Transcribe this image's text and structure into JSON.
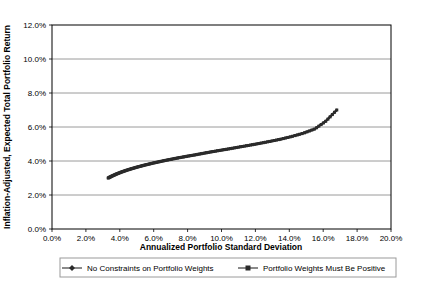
{
  "chart_data": {
    "type": "scatter",
    "title": "",
    "xlabel": "Annualized Portfolio Standard Deviation",
    "ylabel": "Inflation-Adjusted, Expected Total Portfolio Return",
    "xlim": [
      0,
      20
    ],
    "ylim": [
      0,
      12
    ],
    "x_tick_labels": [
      "0.0%",
      "2.0%",
      "4.0%",
      "6.0%",
      "8.0%",
      "10.0%",
      "12.0%",
      "14.0%",
      "16.0%",
      "18.0%",
      "20.0%"
    ],
    "x_tick_values": [
      0,
      2,
      4,
      6,
      8,
      10,
      12,
      14,
      16,
      18,
      20
    ],
    "y_tick_labels": [
      "0.0%",
      "2.0%",
      "4.0%",
      "6.0%",
      "8.0%",
      "10.0%",
      "12.0%"
    ],
    "y_tick_values": [
      0,
      2,
      4,
      6,
      8,
      10,
      12
    ],
    "grid": "horizontal",
    "legend_position": "bottom",
    "series": [
      {
        "name": "No Constraints on Portfolio Weights",
        "marker": "diamond",
        "color": "#2b2b2b",
        "x": [
          3.3,
          3.45,
          3.62,
          3.8,
          4.0,
          4.22,
          4.46,
          4.72,
          5.0,
          5.3,
          5.62,
          5.96,
          6.32,
          6.7,
          7.1,
          7.52,
          7.96,
          8.42,
          8.9,
          9.4,
          9.92,
          10.46,
          11.02,
          11.6,
          12.2,
          12.82,
          13.46,
          14.12,
          14.8,
          15.5,
          16.15,
          16.8
        ],
        "y": [
          3.0,
          3.08,
          3.16,
          3.24,
          3.32,
          3.4,
          3.48,
          3.56,
          3.64,
          3.72,
          3.8,
          3.88,
          3.96,
          4.04,
          4.12,
          4.2,
          4.28,
          4.36,
          4.45,
          4.54,
          4.63,
          4.72,
          4.82,
          4.92,
          5.03,
          5.15,
          5.28,
          5.44,
          5.63,
          5.89,
          6.35,
          7.0
        ]
      },
      {
        "name": "Portfolio Weights Must Be Positive",
        "marker": "square",
        "color": "#2b2b2b",
        "x": [
          3.32,
          3.47,
          3.64,
          3.82,
          4.02,
          4.24,
          4.48,
          4.74,
          5.02,
          5.32,
          5.64,
          5.98,
          6.34,
          6.72,
          7.12,
          7.54,
          7.98,
          8.44,
          8.92,
          9.42,
          9.94,
          10.48,
          11.04,
          11.62,
          12.22,
          12.84,
          13.48,
          14.14,
          14.82,
          15.52,
          16.17,
          16.8
        ],
        "y": [
          3.0,
          3.08,
          3.16,
          3.24,
          3.32,
          3.4,
          3.48,
          3.56,
          3.64,
          3.72,
          3.8,
          3.88,
          3.96,
          4.04,
          4.12,
          4.2,
          4.28,
          4.36,
          4.45,
          4.54,
          4.63,
          4.72,
          4.82,
          4.92,
          5.03,
          5.15,
          5.28,
          5.44,
          5.63,
          5.89,
          6.35,
          7.0
        ]
      }
    ]
  },
  "legend": {
    "items": [
      {
        "label": "No Constraints on Portfolio Weights",
        "marker": "diamond-marker-icon"
      },
      {
        "label": "Portfolio Weights Must Be Positive",
        "marker": "square-marker-icon"
      }
    ]
  },
  "colors": {
    "series": "#2b2b2b",
    "gridline": "#808080",
    "axis": "#000000",
    "legend_border": "#9a9a9a",
    "background": "#ffffff"
  }
}
